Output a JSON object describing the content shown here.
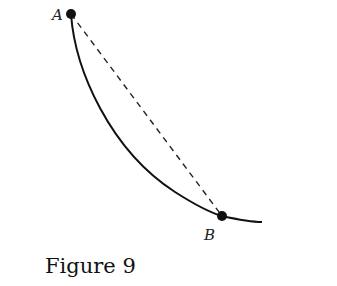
{
  "figure": {
    "caption": "Figure 9",
    "points": [
      {
        "label": "A",
        "x": 71,
        "y": 14
      },
      {
        "label": "B",
        "x": 222,
        "y": 216
      }
    ],
    "curve": "solid curved path from A through B (cycloid-like)",
    "chord": "dashed straight line from A to B",
    "color": "#111111"
  }
}
